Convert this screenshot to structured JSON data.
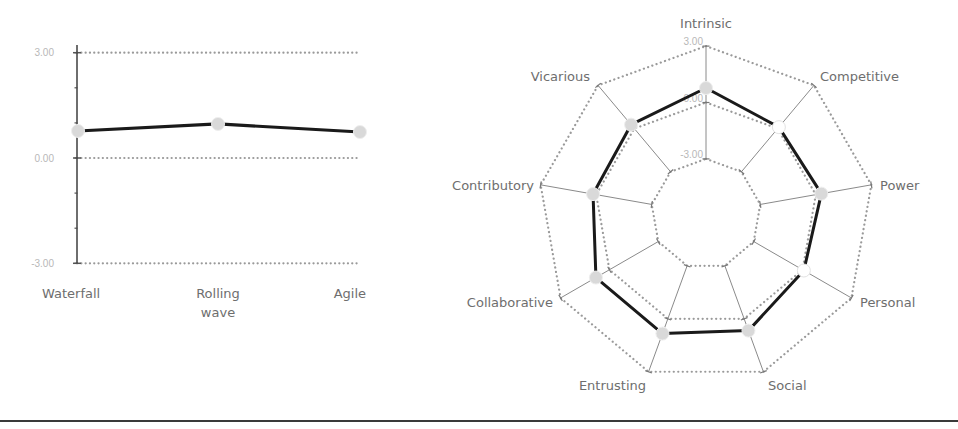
{
  "colors": {
    "line": "#1a1a1a",
    "marker": "#d9d9d9",
    "marker_hollow": "#ffffff",
    "grid": "#9a9a9a",
    "axis": "#7a7a7a",
    "text": "#6e6e6e",
    "tick_text": "#b8b8b8"
  },
  "chart_data": [
    {
      "type": "line",
      "title": "",
      "xlabel": "",
      "ylabel": "",
      "categories": [
        "Waterfall",
        "Rolling wave",
        "Agile"
      ],
      "category_lines": [
        [
          "Waterfall"
        ],
        [
          "Rolling",
          "wave"
        ],
        [
          "Agile"
        ]
      ],
      "values": [
        0.77,
        0.97,
        0.74
      ],
      "ylim": [
        -3.0,
        3.0
      ],
      "yticks": [
        "3.00",
        "0.00",
        "-3.00"
      ],
      "ytick_values": [
        3.0,
        0.0,
        -3.0
      ],
      "grid": "dotted major gridlines at 3.00, 0.00, -3.00",
      "legend": "none"
    },
    {
      "type": "radar",
      "title": "",
      "categories": [
        "Intrinsic",
        "Competitive",
        "Power",
        "Personal",
        "Social",
        "Entrusting",
        "Collaborative",
        "Contributory",
        "Vicarious"
      ],
      "values": [
        0.77,
        0.1,
        0.3,
        0.08,
        0.67,
        0.84,
        0.83,
        0.17,
        0.27
      ],
      "hollow_markers": [
        1,
        3
      ],
      "rlim": [
        -3.0,
        3.0
      ],
      "rticks": [
        "3.00",
        "0.00",
        "-3.00"
      ],
      "rtick_values": [
        3.0,
        0.0,
        -3.0
      ],
      "grid": "dotted nonagon rings at 3.00, 0.00, -3.00",
      "legend": "none"
    }
  ]
}
